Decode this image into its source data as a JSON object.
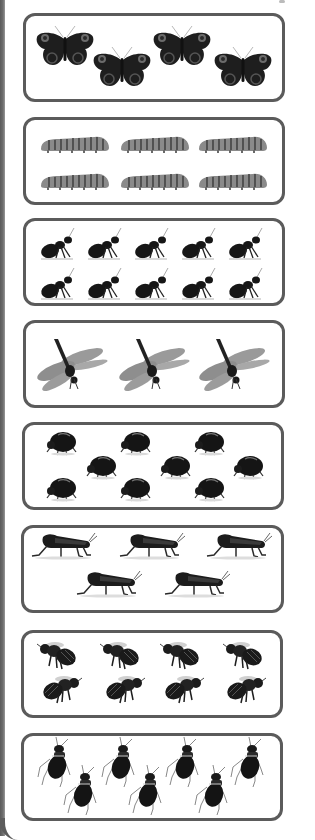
{
  "worksheet": {
    "title": "Count the insects",
    "stroke_color": "#5b5b5b",
    "rows": [
      {
        "name": "butterflies",
        "count": 4,
        "kind": "butterfly",
        "box": {
          "x": 23,
          "y": 13,
          "w": 262,
          "h": 89
        },
        "size": {
          "w": 60,
          "h": 44
        },
        "items": [
          [
            65,
            47
          ],
          [
            122,
            68
          ],
          [
            182,
            47
          ],
          [
            243,
            68
          ]
        ]
      },
      {
        "name": "caterpillars",
        "count": 6,
        "kind": "caterpillar",
        "box": {
          "x": 23,
          "y": 117,
          "w": 262,
          "h": 88
        },
        "size": {
          "w": 72,
          "h": 20
        },
        "items": [
          [
            75,
            143
          ],
          [
            155,
            143
          ],
          [
            233,
            143
          ],
          [
            75,
            180
          ],
          [
            155,
            180
          ],
          [
            233,
            180
          ]
        ]
      },
      {
        "name": "ants",
        "count": 10,
        "kind": "ant",
        "box": {
          "x": 23,
          "y": 218,
          "w": 262,
          "h": 88
        },
        "size": {
          "w": 38,
          "h": 34
        },
        "items": [
          [
            58,
            244
          ],
          [
            105,
            244
          ],
          [
            152,
            244
          ],
          [
            199,
            244
          ],
          [
            246,
            244
          ],
          [
            58,
            284
          ],
          [
            105,
            284
          ],
          [
            152,
            284
          ],
          [
            199,
            284
          ],
          [
            246,
            284
          ]
        ]
      },
      {
        "name": "dragonflies",
        "count": 3,
        "kind": "dragonfly",
        "box": {
          "x": 23,
          "y": 320,
          "w": 262,
          "h": 88
        },
        "size": {
          "w": 76,
          "h": 56
        },
        "items": [
          [
            72,
            365
          ],
          [
            154,
            365
          ],
          [
            234,
            365
          ]
        ]
      },
      {
        "name": "beetles",
        "count": 9,
        "kind": "beetle",
        "box": {
          "x": 22,
          "y": 422,
          "w": 262,
          "h": 88
        },
        "size": {
          "w": 32,
          "h": 26
        },
        "items": [
          [
            62,
            443
          ],
          [
            136,
            443
          ],
          [
            210,
            443
          ],
          [
            102,
            467
          ],
          [
            176,
            467
          ],
          [
            249,
            467
          ],
          [
            62,
            489
          ],
          [
            136,
            489
          ],
          [
            210,
            489
          ]
        ]
      },
      {
        "name": "grasshoppers",
        "count": 5,
        "kind": "grasshopper",
        "box": {
          "x": 21,
          "y": 525,
          "w": 263,
          "h": 88
        },
        "size": {
          "w": 68,
          "h": 30
        },
        "items": [
          [
            65,
            546
          ],
          [
            153,
            546
          ],
          [
            240,
            546
          ],
          [
            110,
            584
          ],
          [
            198,
            584
          ]
        ]
      },
      {
        "name": "bees",
        "count": 8,
        "kind": "bee",
        "box": {
          "x": 21,
          "y": 630,
          "w": 262,
          "h": 88
        },
        "size": {
          "w": 42,
          "h": 30
        },
        "items": [
          [
            58,
            655
          ],
          [
            121,
            655
          ],
          [
            181,
            655
          ],
          [
            244,
            655
          ],
          [
            61,
            689
          ],
          [
            124,
            689
          ],
          [
            183,
            689
          ],
          [
            245,
            689
          ]
        ],
        "flip_second_row": true
      },
      {
        "name": "roaches",
        "count": 7,
        "kind": "roach",
        "box": {
          "x": 21,
          "y": 733,
          "w": 262,
          "h": 88
        },
        "size": {
          "w": 36,
          "h": 50
        },
        "items": [
          [
            56,
            762
          ],
          [
            82,
            790
          ],
          [
            120,
            762
          ],
          [
            147,
            790
          ],
          [
            184,
            762
          ],
          [
            213,
            790
          ],
          [
            249,
            762
          ]
        ]
      }
    ]
  }
}
